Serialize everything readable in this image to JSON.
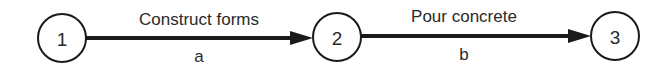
{
  "diagram": {
    "type": "activity-on-arrow network",
    "nodes": [
      {
        "id": "1",
        "label": "1"
      },
      {
        "id": "2",
        "label": "2"
      },
      {
        "id": "3",
        "label": "3"
      }
    ],
    "edges": [
      {
        "from": "1",
        "to": "2",
        "activity": "Construct forms",
        "id": "a"
      },
      {
        "from": "2",
        "to": "3",
        "activity": "Pour concrete",
        "id": "b"
      }
    ],
    "colors": {
      "stroke": "#1a1a1a",
      "text": "#2a2a2a",
      "background": "#ffffff"
    }
  }
}
